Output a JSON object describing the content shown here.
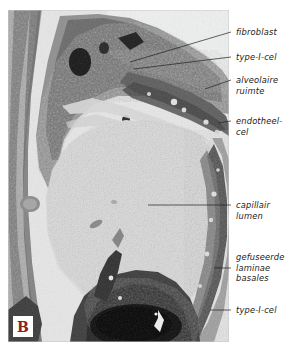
{
  "figure": {
    "panel_letter": "B",
    "panel_letter_color": "#8d1f20",
    "image_type": "transmission-electron-micrograph",
    "background_color": "#ffffff"
  },
  "annotations": [
    {
      "id": "fibroblast",
      "text": "fibroblast",
      "lines": [
        "fibroblast"
      ],
      "leader": {
        "x1": 231,
        "y1": 32,
        "x2": 130,
        "y2": 62
      }
    },
    {
      "id": "type-i-cel-upper",
      "text": "type-I-cel",
      "lines": [
        "type-I-cel"
      ],
      "leader": {
        "x1": 231,
        "y1": 57,
        "x2": 134,
        "y2": 69
      }
    },
    {
      "id": "alveolaire-ruimte",
      "text": "alveolaire\nruimte",
      "lines": [
        "alveolaire",
        "ruimte"
      ],
      "leader": {
        "x1": 231,
        "y1": 80,
        "x2": 205,
        "y2": 89
      }
    },
    {
      "id": "endotheel-cel",
      "text": "endotheel-\ncel",
      "lines": [
        "endotheel-",
        "cel"
      ],
      "leader": {
        "x1": 231,
        "y1": 121,
        "x2": 218,
        "y2": 123
      }
    },
    {
      "id": "capillair-lumen",
      "text": "capillair\nlumen",
      "lines": [
        "capillair",
        "lumen"
      ],
      "leader": {
        "x1": 231,
        "y1": 205,
        "x2": 148,
        "y2": 205
      }
    },
    {
      "id": "gefuseerde-laminae-basales",
      "text": "gefuseerde\nlaminae\nbasales",
      "lines": [
        "gefuseerde",
        "laminae",
        "basales"
      ],
      "leader": {
        "x1": 231,
        "y1": 268,
        "x2": 216,
        "y2": 268
      }
    },
    {
      "id": "type-i-cel-lower",
      "text": "type-I-cel",
      "lines": [
        "type-I-cel"
      ],
      "leader": {
        "x1": 231,
        "y1": 310,
        "x2": 212,
        "y2": 310
      }
    }
  ],
  "micrograph": {
    "regions": [
      {
        "name": "alveolar-space",
        "tone": "light"
      },
      {
        "name": "type-i-cell-cytoplasm",
        "tone": "dark"
      },
      {
        "name": "fibroblast-body",
        "tone": "dark"
      },
      {
        "name": "capillary-lumen",
        "tone": "light-grainy"
      },
      {
        "name": "endothelial-cell",
        "tone": "dark"
      },
      {
        "name": "fused-basal-laminae",
        "tone": "dark-band"
      },
      {
        "name": "erythrocyte",
        "tone": "very-dark"
      }
    ]
  }
}
